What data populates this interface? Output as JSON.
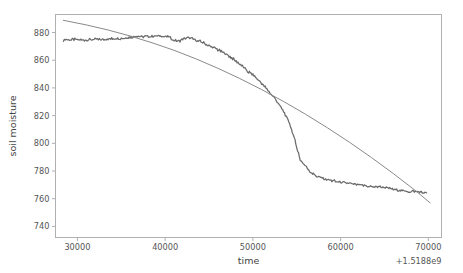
{
  "figure": {
    "background_color": "#ffffff",
    "axes_color": "#b0b0b0",
    "text_color": "#555555"
  },
  "chart_data": {
    "type": "line",
    "title": "",
    "xlabel": "time",
    "ylabel": "soil moisture",
    "x_offset_label": "+1.5188e9",
    "xlim": [
      27500,
      71500
    ],
    "ylim": [
      732,
      893
    ],
    "xticks": [
      30000,
      40000,
      50000,
      60000,
      70000
    ],
    "xtick_labels": [
      "30000",
      "40000",
      "50000",
      "60000",
      "70000"
    ],
    "yticks": [
      740,
      760,
      780,
      800,
      820,
      840,
      860,
      880
    ],
    "ytick_labels": [
      "740",
      "760",
      "780",
      "800",
      "820",
      "840",
      "860",
      "880"
    ],
    "grid": false,
    "legend": "none",
    "series": [
      {
        "name": "measured soil moisture",
        "color": "#6b6b6b",
        "linewidth": 1.25,
        "x": [
          28400,
          29000,
          29600,
          30200,
          30800,
          31400,
          32000,
          32600,
          33200,
          33800,
          34400,
          35000,
          35600,
          36200,
          36800,
          37400,
          38000,
          38600,
          39200,
          39800,
          40400,
          41000,
          41600,
          42200,
          42800,
          43400,
          44000,
          44600,
          45200,
          45800,
          46400,
          47000,
          47600,
          48200,
          48800,
          49400,
          50000,
          50600,
          51200,
          51800,
          52400,
          53000,
          53600,
          54200,
          54800,
          55400,
          56000,
          56600,
          57200,
          57800,
          58400,
          59000,
          59600,
          60200,
          60800,
          61400,
          62000,
          62600,
          63200,
          63800,
          64400,
          65000,
          65600,
          66200,
          66800,
          67400,
          68000,
          68600,
          69200,
          69800
        ],
        "y": [
          874.8,
          874.6,
          874.9,
          874.7,
          874.5,
          874.8,
          875.0,
          874.9,
          875.2,
          875.4,
          875.6,
          875.9,
          876.4,
          876.8,
          877.2,
          877.0,
          877.4,
          877.1,
          877.5,
          877.2,
          876.8,
          874.2,
          873.5,
          875.6,
          876.0,
          874.8,
          873.4,
          871.8,
          870.0,
          868.2,
          866.3,
          864.0,
          861.5,
          858.8,
          855.6,
          852.0,
          849.5,
          846.0,
          842.0,
          837.5,
          833.0,
          828.0,
          822.0,
          814.0,
          802.0,
          788.0,
          783.5,
          779.0,
          776.5,
          775.0,
          773.8,
          773.0,
          772.2,
          771.6,
          771.0,
          770.5,
          770.0,
          769.6,
          769.0,
          768.4,
          768.8,
          768.2,
          767.5,
          766.6,
          766.0,
          765.4,
          765.0,
          765.4,
          764.6,
          764.2
        ]
      },
      {
        "name": "fitted trend",
        "color": "#8a8a8a",
        "linewidth": 1.0,
        "x": [
          28400,
          31000,
          33500,
          36000,
          38500,
          41000,
          43500,
          46000,
          48500,
          51000,
          53500,
          56000,
          58500,
          61000,
          63500,
          66000,
          68500,
          70200
        ],
        "y": [
          888.8,
          885.5,
          881.8,
          877.5,
          872.6,
          867.2,
          861.0,
          854.2,
          846.8,
          838.8,
          830.2,
          821.0,
          811.2,
          800.8,
          789.8,
          778.2,
          766.0,
          757.0
        ]
      }
    ]
  },
  "axis_labels": {
    "x_title": "time",
    "y_title": "soil moisture",
    "x_offset": "+1.5188e9"
  }
}
